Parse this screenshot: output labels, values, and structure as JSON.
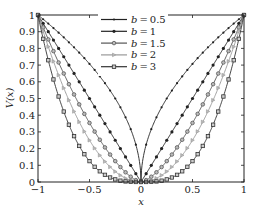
{
  "chart_data": {
    "type": "line",
    "title": "",
    "xlabel": "x",
    "ylabel": "V(x)",
    "xlim": [
      -1,
      1
    ],
    "ylim": [
      0,
      1
    ],
    "xticks": [
      "-1",
      "-0.5",
      "0",
      "0.5",
      "1"
    ],
    "yticks": [
      "0",
      "0.1",
      "0.2",
      "0.3",
      "0.4",
      "0.5",
      "0.6",
      "0.7",
      "0.8",
      "0.9",
      "1"
    ],
    "grid": false,
    "legend_position": "upper center",
    "function": "V(x) = |x|^b",
    "x": [
      -1,
      -0.95,
      -0.9,
      -0.85,
      -0.8,
      -0.75,
      -0.7,
      -0.65,
      -0.6,
      -0.55,
      -0.5,
      -0.45,
      -0.4,
      -0.35,
      -0.3,
      -0.25,
      -0.2,
      -0.15,
      -0.1,
      -0.05,
      0,
      0.05,
      0.1,
      0.15,
      0.2,
      0.25,
      0.3,
      0.35,
      0.4,
      0.45,
      0.5,
      0.55,
      0.6,
      0.65,
      0.7,
      0.75,
      0.8,
      0.85,
      0.9,
      0.95,
      1
    ],
    "series": [
      {
        "name": "b=0.5",
        "b": 0.5,
        "marker": "dot-small",
        "color": "#222222"
      },
      {
        "name": "b=1",
        "b": 1,
        "marker": "dot",
        "color": "#222222"
      },
      {
        "name": "b=1.5",
        "b": 1.5,
        "marker": "circle",
        "color": "#555555"
      },
      {
        "name": "b=2",
        "b": 2,
        "marker": "triangle-right",
        "color": "#999999"
      },
      {
        "name": "b=3",
        "b": 3,
        "marker": "square",
        "color": "#333333"
      }
    ]
  },
  "legend": {
    "items": [
      {
        "label": "b = 0.5"
      },
      {
        "label": "b = 1"
      },
      {
        "label": "b = 1.5"
      },
      {
        "label": "b = 2"
      },
      {
        "label": "b = 3"
      }
    ]
  }
}
